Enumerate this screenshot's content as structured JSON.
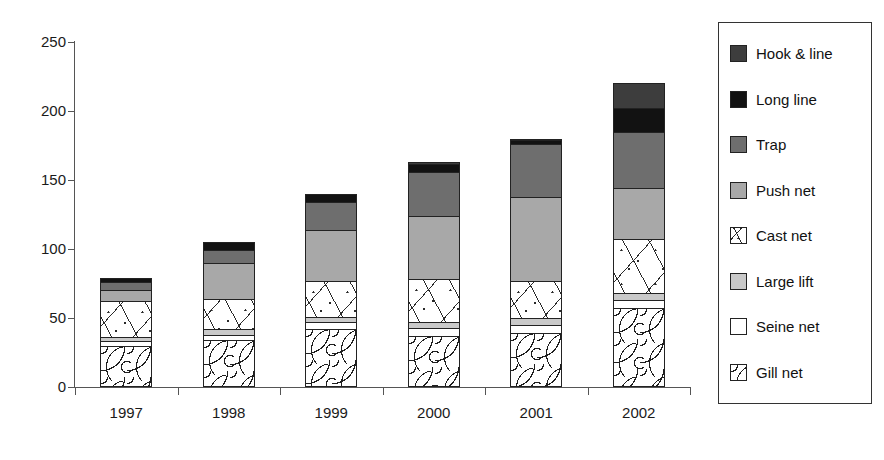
{
  "chart_data": {
    "type": "bar",
    "subtype": "stacked-bar",
    "title": "",
    "xlabel": "",
    "ylabel": "",
    "ylim": [
      0,
      250
    ],
    "yticks": [
      0,
      50,
      100,
      150,
      200,
      250
    ],
    "grid": false,
    "legend_position": "right",
    "categories": [
      "1997",
      "1998",
      "1999",
      "2000",
      "2001",
      "2002"
    ],
    "series": [
      {
        "name": "Gill net",
        "color": "#ffffff",
        "pattern": "squiggle",
        "values": [
          30,
          34,
          42,
          37,
          39,
          57
        ]
      },
      {
        "name": "Seine net",
        "color": "#ffffff",
        "pattern": "solid",
        "values": [
          3,
          4,
          5,
          6,
          6,
          6
        ]
      },
      {
        "name": "Large lift",
        "color": "#c9c9c9",
        "pattern": "solid",
        "values": [
          3,
          4,
          4,
          4,
          5,
          5
        ]
      },
      {
        "name": "Cast net",
        "color": "#ffffff",
        "pattern": "lines",
        "values": [
          26,
          22,
          26,
          31,
          27,
          39
        ]
      },
      {
        "name": "Push net",
        "color": "#a8a8a8",
        "pattern": "solid",
        "values": [
          8,
          26,
          37,
          46,
          61,
          37
        ]
      },
      {
        "name": "Trap",
        "color": "#6e6e6e",
        "pattern": "solid",
        "values": [
          6,
          9,
          20,
          32,
          38,
          41
        ]
      },
      {
        "name": "Long line",
        "color": "#121212",
        "pattern": "solid",
        "values": [
          3,
          6,
          6,
          6,
          3,
          17
        ]
      },
      {
        "name": "Hook & line",
        "color": "#3d3d3d",
        "pattern": "solid",
        "values": [
          0,
          0,
          0,
          1,
          1,
          18
        ]
      }
    ],
    "totals": [
      79,
      105,
      140,
      163,
      180,
      233
    ]
  },
  "legend": {
    "items": [
      {
        "label": "Hook & line"
      },
      {
        "label": "Long line"
      },
      {
        "label": "Trap"
      },
      {
        "label": "Push net"
      },
      {
        "label": "Cast net"
      },
      {
        "label": "Large lift"
      },
      {
        "label": "Seine net"
      },
      {
        "label": "Gill net"
      }
    ]
  }
}
